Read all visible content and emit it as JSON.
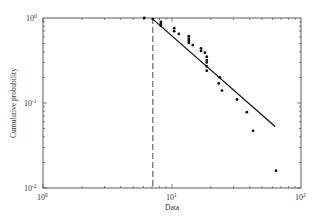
{
  "chart_data": {
    "type": "scatter",
    "title": "",
    "xlabel": "Data",
    "ylabel": "Cumulative probability",
    "xscale": "log",
    "yscale": "log",
    "xlim": [
      1,
      100
    ],
    "ylim": [
      0.01,
      1
    ],
    "grid": false,
    "legend": null,
    "x_ticks": [
      {
        "base": "10",
        "exp": "0",
        "value": 1
      },
      {
        "base": "10",
        "exp": "1",
        "value": 10
      },
      {
        "base": "10",
        "exp": "2",
        "value": 100
      }
    ],
    "y_ticks": [
      {
        "base": "10",
        "exp": "0",
        "value": 1
      },
      {
        "base": "10",
        "exp": "-1",
        "value": 0.1
      },
      {
        "base": "10",
        "exp": "-2",
        "value": 0.01
      }
    ],
    "series": [
      {
        "name": "empirical data",
        "type": "scatter",
        "marker": "dot",
        "color": "#111111",
        "points": [
          [
            6.1,
            1.0
          ],
          [
            7.1,
            0.97
          ],
          [
            8.2,
            0.9
          ],
          [
            8.2,
            0.85
          ],
          [
            8.2,
            0.81
          ],
          [
            10.4,
            0.76
          ],
          [
            10.4,
            0.7
          ],
          [
            11.3,
            0.65
          ],
          [
            13.5,
            0.61
          ],
          [
            13.5,
            0.57
          ],
          [
            13.5,
            0.54
          ],
          [
            13.5,
            0.51
          ],
          [
            14.5,
            0.48
          ],
          [
            16.8,
            0.44
          ],
          [
            16.8,
            0.41
          ],
          [
            18.0,
            0.39
          ],
          [
            18.6,
            0.35
          ],
          [
            18.6,
            0.32
          ],
          [
            18.6,
            0.3
          ],
          [
            18.6,
            0.27
          ],
          [
            18.6,
            0.24
          ],
          [
            23.5,
            0.2
          ],
          [
            23.0,
            0.17
          ],
          [
            24.4,
            0.14
          ],
          [
            31.9,
            0.11
          ],
          [
            38.0,
            0.078
          ],
          [
            42.5,
            0.047
          ],
          [
            64.0,
            0.016
          ]
        ]
      },
      {
        "name": "power-law fit",
        "type": "line",
        "style": "solid",
        "color": "#111111",
        "points": [
          [
            7.1,
            0.97
          ],
          [
            63.0,
            0.053
          ]
        ]
      },
      {
        "name": "xmin threshold",
        "type": "vline",
        "style": "dashed",
        "color": "#333333",
        "x": 7.1
      }
    ]
  }
}
